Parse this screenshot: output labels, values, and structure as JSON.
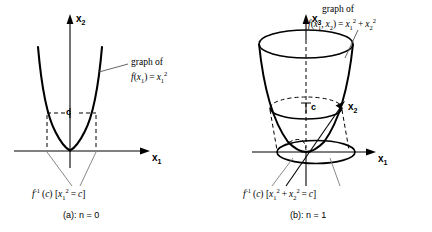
{
  "figure": {
    "panels": [
      {
        "id": "panel-a",
        "caption": "(a): n = 0",
        "axes": {
          "horizontal": "x",
          "horizontal_sub": "1",
          "vertical": "x",
          "vertical_sub": "2"
        },
        "level_label": "c",
        "graph_annotation_line1": "graph of",
        "graph_annotation_line2_parts": {
          "f": "f",
          "open": "(",
          "arg": "x",
          "arg_sub": "1",
          "close": ")",
          "eq": "=",
          "rhs": "x",
          "rhs_sub": "1",
          "rhs_sup": "2"
        },
        "levelset_label_parts": {
          "f": "f",
          "inv": "-1",
          "c_open": "(",
          "c": "c",
          "c_close": ")",
          "br_open": "[",
          "v1": "x",
          "v1_sub": "1",
          "v1_sup": "2",
          "eq": "=",
          "rhs": "c",
          "br_close": "]"
        }
      },
      {
        "id": "panel-b",
        "caption": "(b): n = 1",
        "axes": {
          "horizontal": "x",
          "horizontal_sub": "1",
          "vertical": "x",
          "vertical_sub": "3",
          "depth": "x",
          "depth_sub": "2"
        },
        "level_label": "c",
        "graph_annotation_line1": "graph of",
        "graph_annotation_line2_parts": {
          "f": "f",
          "open": "(",
          "arg1": "x",
          "arg1_sub": "1",
          "comma": ",",
          "arg2": "x",
          "arg2_sub": "2",
          "close": ")",
          "eq": "=",
          "t1": "x",
          "t1_sub": "1",
          "t1_sup": "2",
          "plus": "+",
          "t2": "x",
          "t2_sub": "2",
          "t2_sup": "2"
        },
        "levelset_label_parts": {
          "f": "f",
          "inv": "-1",
          "c_open": "(",
          "c": "c",
          "c_close": ")",
          "br_open": "[",
          "v1": "x",
          "v1_sub": "1",
          "v1_sup": "2",
          "plus": "+",
          "v2": "x",
          "v2_sub": "2",
          "v2_sup": "2",
          "eq": "=",
          "rhs": "c",
          "br_close": "]"
        }
      }
    ],
    "colors": {
      "ink": "#000000",
      "leader": "#7a7a7a",
      "background": "#ffffff"
    }
  }
}
